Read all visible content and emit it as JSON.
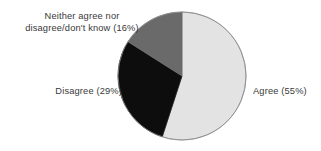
{
  "chart_data": {
    "type": "pie",
    "title": "",
    "subtitle": "",
    "xlabel": "",
    "ylabel": "",
    "grid": false,
    "legend_position": "none",
    "label_placement": "outside",
    "start_angle_deg": 0,
    "direction": "clockwise",
    "categories": [
      "Agree",
      "Disagree",
      "Neither agree nor disagree/don't know"
    ],
    "values": [
      55,
      29,
      16
    ],
    "units": "percent",
    "total": 100,
    "slices": [
      {
        "name": "Agree",
        "value": 55,
        "label": "Agree (55%)",
        "color": "#e3e3e3",
        "start_deg": 0,
        "end_deg": 198
      },
      {
        "name": "Disagree",
        "value": 29,
        "label": "Disagree (29%)",
        "color": "#0d0d0d",
        "start_deg": 198,
        "end_deg": 302.4
      },
      {
        "name": "Neither agree nor disagree/don't know",
        "value": 16,
        "label": "Neither agree nor\ndisagree/don't know (16%)",
        "color": "#6a6a6a",
        "start_deg": 302.4,
        "end_deg": 360
      }
    ],
    "outline_color": "#8c8c8c",
    "background_color": "#ffffff",
    "text_color": "#2b2b2b"
  },
  "labels": {
    "agree": "Agree (55%)",
    "disagree": "Disagree (29%)",
    "neither": "Neither agree nor\ndisagree/don't know (16%)"
  }
}
